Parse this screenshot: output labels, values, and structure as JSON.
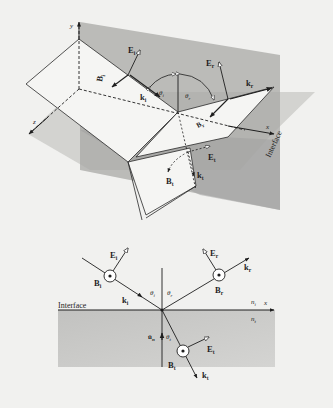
{
  "figure": {
    "top_panel": {
      "description": "3D view of incident, reflected and transmitted plane waves at a planar interface",
      "axes": {
        "y": "y",
        "x": "x",
        "z": "z"
      },
      "plane_label": "Interface",
      "vectors": {
        "E_i": {
          "symbol": "E",
          "sub": "i"
        },
        "B_i": {
          "symbol": "B",
          "sub": "i"
        },
        "k_i": {
          "symbol": "k",
          "sub": "i"
        },
        "E_r": {
          "symbol": "E",
          "sub": "r"
        },
        "B_r": {
          "symbol": "B",
          "sub": "r"
        },
        "k_r": {
          "symbol": "k",
          "sub": "r"
        },
        "E_t": {
          "symbol": "E",
          "sub": "t"
        },
        "B_t": {
          "symbol": "B",
          "sub": "t"
        },
        "k_t": {
          "symbol": "k",
          "sub": "t"
        }
      },
      "angles": {
        "theta_i": {
          "symbol": "θ",
          "sub": "i"
        },
        "theta_r": {
          "symbol": "θ",
          "sub": "r"
        }
      }
    },
    "bottom_panel": {
      "description": "2D cross-section of reflection and refraction at interface",
      "interface_label": "Interface",
      "axis_x": "x",
      "n_i": {
        "symbol": "n",
        "sub": "i"
      },
      "n_t": {
        "symbol": "n",
        "sub": "t"
      },
      "normal": {
        "symbol": "û",
        "sub": "n"
      },
      "angles": {
        "theta_i": {
          "symbol": "θ",
          "sub": "i"
        },
        "theta_r": {
          "symbol": "θ",
          "sub": "r"
        },
        "theta_t": {
          "symbol": "θ",
          "sub": "t"
        }
      },
      "vectors": {
        "E_i": {
          "symbol": "E",
          "sub": "i"
        },
        "B_i": {
          "symbol": "B",
          "sub": "i"
        },
        "k_i": {
          "symbol": "k",
          "sub": "i"
        },
        "E_r": {
          "symbol": "E",
          "sub": "r"
        },
        "B_r": {
          "symbol": "B",
          "sub": "r"
        },
        "k_r": {
          "symbol": "k",
          "sub": "r"
        },
        "E_t": {
          "symbol": "E",
          "sub": "t"
        },
        "B_t": {
          "symbol": "B",
          "sub": "t"
        },
        "k_t": {
          "symbol": "k",
          "sub": "t"
        }
      }
    },
    "colors": {
      "background": "#f1f1ef",
      "interface_plane": "#b4b4b2",
      "plane_of_incidence": "#a4a4a2",
      "wave_plane": "#f4f4f2",
      "medium_t": "#bdbdbb",
      "line": "#2a2a2a"
    }
  }
}
